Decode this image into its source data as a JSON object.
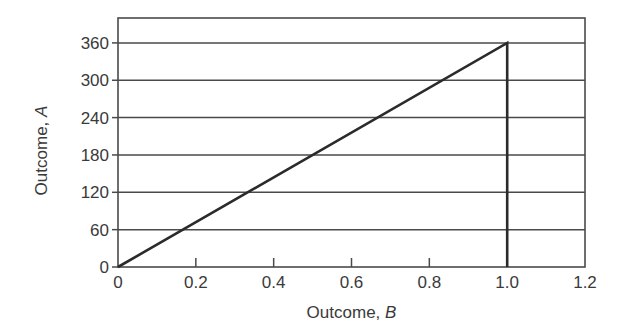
{
  "chart_data": {
    "type": "line",
    "title": "",
    "xlabel": "Outcome, ",
    "xlabel_italic": "B",
    "ylabel": "Outcome, ",
    "ylabel_italic": "A",
    "xlim": [
      0,
      1.2
    ],
    "ylim": [
      0,
      400
    ],
    "x_ticks": [
      "0",
      "0.2",
      "0.4",
      "0.6",
      "0.8",
      "1.0",
      "1.2"
    ],
    "x_tick_values": [
      0,
      0.2,
      0.4,
      0.6,
      0.8,
      1.0,
      1.2
    ],
    "y_ticks": [
      "0",
      "60",
      "120",
      "180",
      "240",
      "300",
      "360"
    ],
    "y_tick_values": [
      0,
      60,
      120,
      180,
      240,
      300,
      360
    ],
    "grid": {
      "horizontal": true,
      "vertical": false
    },
    "legend": null,
    "series": [
      {
        "name": "A vs B",
        "x": [
          0,
          1.0,
          1.0
        ],
        "y": [
          0,
          360,
          0
        ]
      }
    ],
    "colors": {
      "line": "#2b2b2b",
      "grid": "#4a4a4a",
      "axis": "#4a4a4a"
    }
  }
}
